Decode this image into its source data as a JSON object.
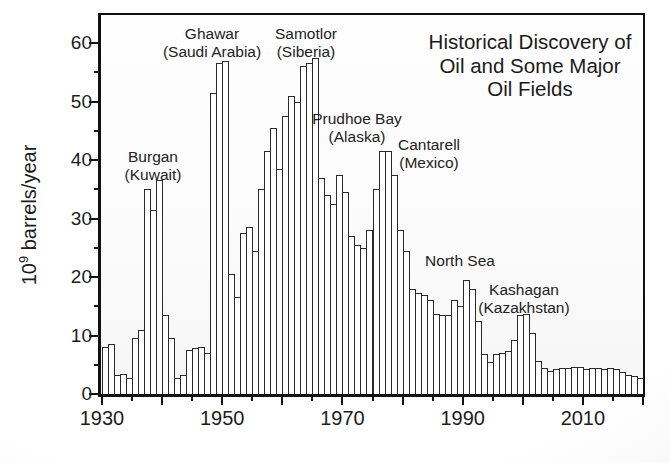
{
  "title": {
    "lines": [
      "Historical Discovery of",
      "Oil and Some Major",
      "Oil Fields"
    ]
  },
  "y_axis": {
    "label_base": "10",
    "label_superscript": "9",
    "label_rest": " barrels/year",
    "tick_labels": [
      0,
      10,
      20,
      30,
      40,
      50,
      60
    ],
    "minor_ticks": [
      5,
      15,
      25,
      35,
      45,
      55
    ]
  },
  "x_axis": {
    "tick_labels": [
      1930,
      1950,
      1970,
      1990,
      2010
    ],
    "major_ticks": [
      1930,
      1940,
      1950,
      1960,
      1970,
      1980,
      1990,
      2000,
      2010,
      2020
    ],
    "minor_ticks": [
      1935,
      1945,
      1955,
      1965,
      1975,
      1985,
      1995,
      2005,
      2015
    ]
  },
  "chart_data": {
    "type": "bar",
    "title": "Historical Discovery of Oil and Some Major Oil Fields",
    "xlabel": "",
    "ylabel": "10^9 barrels/year",
    "x_start_year": 1930,
    "x_end_year": 2019,
    "xlim": [
      1930,
      2020
    ],
    "ylim": [
      0,
      65
    ],
    "grid": false,
    "bar_fill": "#fefefe",
    "bar_outline": "#2a2a2a",
    "values": [
      8,
      8.5,
      3.2,
      3.5,
      2.8,
      9.5,
      11,
      35,
      31.5,
      36.5,
      13.5,
      9.5,
      2.8,
      3.2,
      7.5,
      7.8,
      8,
      7,
      51.5,
      56.5,
      57,
      20.5,
      16.5,
      27.5,
      28.5,
      24.5,
      35,
      41.5,
      45.5,
      38.5,
      47.5,
      51,
      50,
      56,
      56.5,
      57.5,
      37,
      34,
      32.5,
      37.5,
      34.5,
      27,
      25.5,
      25,
      28,
      35,
      41.5,
      41.5,
      37.5,
      28,
      24.5,
      18,
      17.3,
      17,
      16,
      13.6,
      13.5,
      13.5,
      16,
      15,
      19.5,
      18,
      12.5,
      6.8,
      5.5,
      6.8,
      7,
      7.3,
      9.2,
      13.5,
      13.7,
      10.5,
      5.6,
      4.5,
      4,
      4.3,
      4.5,
      4.5,
      4.7,
      4.7,
      4.3,
      4.5,
      4.5,
      4.3,
      4.5,
      4.3,
      3.7,
      3.2,
      3,
      2.8
    ],
    "annotations": [
      {
        "id": "burgan",
        "lines": [
          "Burgan",
          "(Kuwait)"
        ],
        "year": 1938,
        "x": 153,
        "y": 148
      },
      {
        "id": "ghawar",
        "lines": [
          "Ghawar",
          "(Saudi Arabia)"
        ],
        "year": 1948,
        "x": 212,
        "y": 25
      },
      {
        "id": "samotlor",
        "lines": [
          "Samotlor",
          "(Siberia)"
        ],
        "year": 1965,
        "x": 306,
        "y": 25
      },
      {
        "id": "prudhoe-bay",
        "lines": [
          "Prudhoe Bay",
          "(Alaska)"
        ],
        "year": 1968,
        "x": 357,
        "y": 110
      },
      {
        "id": "cantarell",
        "lines": [
          "Cantarell",
          "(Mexico)"
        ],
        "year": 1976,
        "x": 429,
        "y": 136
      },
      {
        "id": "north-sea",
        "lines": [
          "North Sea"
        ],
        "year": 1990,
        "x": 460,
        "y": 252
      },
      {
        "id": "kashagan",
        "lines": [
          "Kashagan",
          "(Kazakhstan)"
        ],
        "year": 2000,
        "x": 524,
        "y": 281
      }
    ]
  }
}
